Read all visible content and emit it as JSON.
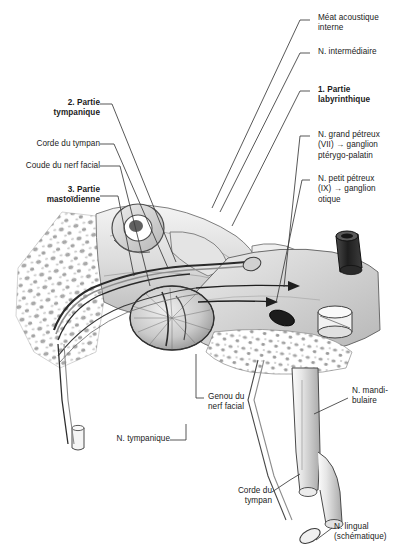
{
  "figure": {
    "title_visible": false,
    "background_color": "#ffffff",
    "ink_color": "#1b1b1b",
    "style": "grayscale pen-and-ink anatomical illustration"
  },
  "labels_right": [
    {
      "id": "meat-acoustique-interne",
      "text": "Méat acoustique\ninterne",
      "bold": false
    },
    {
      "id": "nerf-intermediaire",
      "text": "N. intermédiaire",
      "bold": false
    },
    {
      "id": "partie-labyrinthique",
      "text": "1. Partie\nlabyrinthique",
      "bold": true
    },
    {
      "id": "nerf-grand-petreux",
      "text": "N. grand pétreux\n(VII) → ganglion\nptérygo-palatin",
      "bold": false
    },
    {
      "id": "nerf-petit-petreux",
      "text": "N. petit pétreux\n(IX) → ganglion\notique",
      "bold": false
    },
    {
      "id": "nerf-mandibulaire",
      "text": "N. mandi-\nbulaire",
      "bold": false
    },
    {
      "id": "nerf-lingual",
      "text": "N. lingual\n(schématique)",
      "bold": false
    }
  ],
  "labels_left": [
    {
      "id": "partie-tympanique",
      "text": "2. Partie\ntympanique",
      "bold": true
    },
    {
      "id": "corde-du-tympan-haut",
      "text": "Corde du tympan",
      "bold": false
    },
    {
      "id": "coude-du-nerf-facial",
      "text": "Coude du nerf facial",
      "bold": false
    },
    {
      "id": "partie-mastoidienne",
      "text": "3. Partie\nmastoïdienne",
      "bold": true
    }
  ],
  "labels_bottom": [
    {
      "id": "genou-du-nerf-facial",
      "text": "Genou du\nnerf facial",
      "bold": false
    },
    {
      "id": "nerf-tympanique",
      "text": "N. tympanique",
      "bold": false
    },
    {
      "id": "corde-du-tympan-bas",
      "text": "Corde du\ntympan",
      "bold": false
    }
  ],
  "anatomy_parts": [
    {
      "id": "mastoid-air-cells",
      "name": "mastoid air cells"
    },
    {
      "id": "tympanic-membrane",
      "name": "tympanic membrane"
    },
    {
      "id": "cochlea-spiral",
      "name": "cochlea"
    },
    {
      "id": "semicircular-canal",
      "name": "semicircular canal loop"
    },
    {
      "id": "pterygopalatine-ganglion",
      "name": "pterygopalatine ganglion cylinder"
    },
    {
      "id": "otic-ganglion",
      "name": "otic ganglion cylinder"
    },
    {
      "id": "geniculate-ganglion",
      "name": "geniculate ganglion"
    },
    {
      "id": "mandibular-nerve-trunk",
      "name": "mandibular nerve trunk"
    },
    {
      "id": "lingual-nerve-branch",
      "name": "lingual nerve branch"
    },
    {
      "id": "chorda-tympani-strand",
      "name": "chorda tympani strand"
    }
  ]
}
